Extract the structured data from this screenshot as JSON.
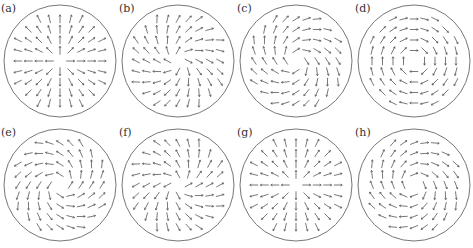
{
  "figure": {
    "panels": [
      {
        "id": "a",
        "label": "(a)",
        "x": 0,
        "y": 0,
        "field": "radial",
        "chirality": 0
      },
      {
        "id": "b",
        "label": "(b)",
        "x": 118,
        "y": 0,
        "field": "spiral",
        "chirality": 0.5
      },
      {
        "id": "c",
        "label": "(c)",
        "x": 236,
        "y": 0,
        "field": "spiral",
        "chirality": 1.0
      },
      {
        "id": "d",
        "label": "(d)",
        "x": 354,
        "y": 0,
        "field": "vortex",
        "chirality": 1.5708
      },
      {
        "id": "e",
        "label": "(e)",
        "x": 0,
        "y": 124,
        "field": "spiral",
        "chirality": -1.0
      },
      {
        "id": "f",
        "label": "(f)",
        "x": 118,
        "y": 124,
        "field": "spiral",
        "chirality": -0.5
      },
      {
        "id": "g",
        "label": "(g)",
        "x": 236,
        "y": 124,
        "field": "radial",
        "chirality": 0
      },
      {
        "id": "h",
        "label": "(h)",
        "x": 354,
        "y": 124,
        "field": "spiral",
        "chirality": 1.2
      }
    ],
    "circle_radius": 56,
    "grid_spacing": 10.5,
    "stroke_color": "#555555"
  }
}
